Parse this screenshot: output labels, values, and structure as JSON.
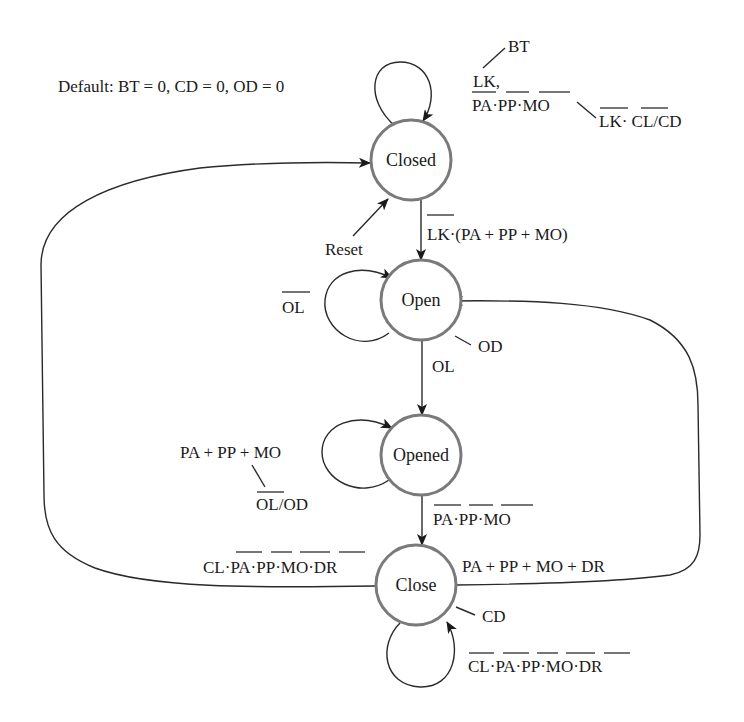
{
  "diagram": {
    "type": "state-machine",
    "default_note": "Default: BT = 0, CD = 0, OD = 0",
    "states": [
      {
        "id": "closed",
        "label": "Closed",
        "output": "",
        "cx": 411,
        "cy": 160
      },
      {
        "id": "open",
        "label": "Open",
        "output": "OD",
        "cx": 411,
        "cy": 300
      },
      {
        "id": "opened",
        "label": "Opened",
        "output": "",
        "cx": 411,
        "cy": 455
      },
      {
        "id": "close",
        "label": "Close",
        "output": "CD",
        "cx": 416,
        "cy": 585
      }
    ],
    "reset_label": "Reset",
    "transitions": [
      {
        "from": "closed",
        "to": "closed",
        "condition": "LK, ¬PA·¬PP·¬MO",
        "cond_line1": "LK,",
        "cond_line2": "PA·PP·MO",
        "output": "BT",
        "alt_output": "LK· CL/CD"
      },
      {
        "from": "closed",
        "to": "open",
        "condition": "¬LK·(PA + PP + MO)",
        "text": "LK·(PA + PP + MO)"
      },
      {
        "from": "open",
        "to": "open",
        "condition": "¬OL",
        "text": "OL"
      },
      {
        "from": "open",
        "to": "opened",
        "condition": "OL",
        "text": "OL"
      },
      {
        "from": "opened",
        "to": "opened",
        "condition": "PA + PP + MO",
        "text": "PA + PP + MO",
        "output": "OL/OD"
      },
      {
        "from": "opened",
        "to": "close",
        "condition": "¬PA·¬PP·¬MO",
        "text": "PA·PP·MO"
      },
      {
        "from": "close",
        "to": "closed",
        "condition": "CL·¬PA·¬PP·¬MO·¬DR",
        "text": "CL·PA·PP·MO·DR"
      },
      {
        "from": "close",
        "to": "open",
        "condition": "PA + PP + MO + DR",
        "text": "PA + PP + MO + DR"
      },
      {
        "from": "close",
        "to": "close",
        "condition": "¬CL·¬PA·¬PP·¬MO·¬DR",
        "text": "CL·PA·PP·MO·DR"
      }
    ]
  }
}
